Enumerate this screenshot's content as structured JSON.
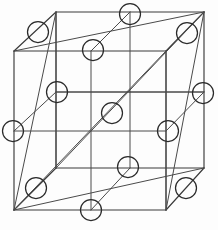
{
  "figure": {
    "kind": "crystal-lattice-diagram",
    "projection": "oblique (cavalier) parallel projection",
    "background_color": "#fdfdfd",
    "line_color": "#3a3a3a",
    "atom_stroke_color": "#2b2b2b",
    "atom_fill": "none",
    "atom_radius": 10.5,
    "canvas": {
      "width": 218,
      "height": 230
    }
  },
  "geometry": {
    "cube_vertices": {
      "front_top_left": {
        "x": 14,
        "y": 51
      },
      "front_top_right": {
        "x": 166,
        "y": 51
      },
      "front_bottom_left": {
        "x": 14,
        "y": 210
      },
      "front_bottom_right": {
        "x": 166,
        "y": 210
      },
      "back_top_left": {
        "x": 56,
        "y": 12
      },
      "back_top_right": {
        "x": 204,
        "y": 12
      },
      "back_bottom_left": {
        "x": 56,
        "y": 168
      },
      "back_bottom_right": {
        "x": 204,
        "y": 168
      }
    },
    "edges": [
      {
        "name": "front-top",
        "x1": 14,
        "y1": 51,
        "x2": 166,
        "y2": 51
      },
      {
        "name": "front-right",
        "x1": 166,
        "y1": 51,
        "x2": 166,
        "y2": 210
      },
      {
        "name": "front-bottom",
        "x1": 166,
        "y1": 210,
        "x2": 14,
        "y2": 210
      },
      {
        "name": "front-left",
        "x1": 14,
        "y1": 210,
        "x2": 14,
        "y2": 51
      },
      {
        "name": "back-top",
        "x1": 56,
        "y1": 12,
        "x2": 204,
        "y2": 12
      },
      {
        "name": "back-right",
        "x1": 204,
        "y1": 12,
        "x2": 204,
        "y2": 168
      },
      {
        "name": "back-bottom",
        "x1": 204,
        "y1": 168,
        "x2": 56,
        "y2": 168
      },
      {
        "name": "back-left",
        "x1": 56,
        "y1": 168,
        "x2": 56,
        "y2": 12
      },
      {
        "name": "depth-top-left",
        "x1": 14,
        "y1": 51,
        "x2": 56,
        "y2": 12
      },
      {
        "name": "depth-top-right",
        "x1": 166,
        "y1": 51,
        "x2": 204,
        "y2": 12
      },
      {
        "name": "depth-bottom-left",
        "x1": 14,
        "y1": 210,
        "x2": 56,
        "y2": 168
      },
      {
        "name": "depth-bottom-right",
        "x1": 166,
        "y1": 210,
        "x2": 204,
        "y2": 168
      }
    ],
    "face_diagonals": [
      {
        "name": "top-face-diagonal",
        "x1": 14,
        "y1": 51,
        "x2": 204,
        "y2": 12
      },
      {
        "name": "bottom-face-diagonal",
        "x1": 14,
        "y1": 210,
        "x2": 204,
        "y2": 168
      },
      {
        "name": "left-face-diagonal",
        "x1": 14,
        "y1": 210,
        "x2": 56,
        "y2": 12
      },
      {
        "name": "right-face-diagonal",
        "x1": 166,
        "y1": 210,
        "x2": 204,
        "y2": 12
      },
      {
        "name": "front-face-diagonal",
        "x1": 14,
        "y1": 210,
        "x2": 166,
        "y2": 51
      },
      {
        "name": "back-face-diagonal",
        "x1": 56,
        "y1": 168,
        "x2": 204,
        "y2": 12
      }
    ],
    "interior_guides": [
      {
        "name": "mid-horizontal-front-plane",
        "x1": 14,
        "y1": 131,
        "x2": 166,
        "y2": 131
      },
      {
        "name": "mid-horizontal-back-plane",
        "x1": 56,
        "y1": 92,
        "x2": 204,
        "y2": 92
      },
      {
        "name": "mid-vertical-front-plane",
        "x1": 91,
        "y1": 51,
        "x2": 91,
        "y2": 210
      },
      {
        "name": "mid-vertical-back-plane",
        "x1": 130,
        "y1": 12,
        "x2": 130,
        "y2": 168
      },
      {
        "name": "mid-depth-top",
        "x1": 91,
        "y1": 51,
        "x2": 130,
        "y2": 12
      },
      {
        "name": "mid-depth-bottom",
        "x1": 91,
        "y1": 210,
        "x2": 130,
        "y2": 168
      },
      {
        "name": "mid-depth-left",
        "x1": 14,
        "y1": 131,
        "x2": 56,
        "y2": 92
      },
      {
        "name": "mid-depth-right",
        "x1": 166,
        "y1": 131,
        "x2": 204,
        "y2": 92
      },
      {
        "name": "mid-plane-vertical-left",
        "x1": 56,
        "y1": 12,
        "x2": 56,
        "y2": 168
      },
      {
        "name": "mid-plane-vertical-right",
        "x1": 166,
        "y1": 51,
        "x2": 166,
        "y2": 210
      },
      {
        "name": "mid-plane-horizontal-a",
        "x1": 130,
        "y1": 92,
        "x2": 204,
        "y2": 92
      },
      {
        "name": "mid-plane-horizontal-b",
        "x1": 56,
        "y1": 92,
        "x2": 130,
        "y2": 92
      }
    ]
  },
  "atoms": [
    {
      "id": "corner-front-top-left",
      "role": "corner",
      "x": 14,
      "y": 51
    },
    {
      "id": "corner-front-top-right",
      "role": "corner",
      "x": 166,
      "y": 51
    },
    {
      "id": "corner-front-bottom-left",
      "role": "corner",
      "x": 14,
      "y": 210
    },
    {
      "id": "corner-front-bottom-right",
      "role": "corner",
      "x": 166,
      "y": 210
    },
    {
      "id": "corner-back-top-left",
      "role": "corner",
      "x": 56,
      "y": 12
    },
    {
      "id": "corner-back-top-right",
      "role": "corner",
      "x": 204,
      "y": 12
    },
    {
      "id": "corner-back-bottom-left",
      "role": "corner",
      "x": 56,
      "y": 168
    },
    {
      "id": "corner-back-bottom-right",
      "role": "corner",
      "x": 204,
      "y": 168
    },
    {
      "id": "face-centre-top",
      "role": "face-centre",
      "x": 110,
      "y": 31
    },
    {
      "id": "face-centre-bottom",
      "role": "face-centre",
      "x": 110,
      "y": 189
    },
    {
      "id": "face-centre-left",
      "role": "face-centre",
      "x": 35,
      "y": 110
    },
    {
      "id": "face-centre-right",
      "role": "face-centre",
      "x": 185,
      "y": 110
    },
    {
      "id": "face-centre-front",
      "role": "face-centre",
      "x": 90,
      "y": 131
    },
    {
      "id": "face-centre-back",
      "role": "face-centre",
      "x": 130,
      "y": 90
    }
  ],
  "visible_atom_markers": [
    {
      "id": "marker-1",
      "x": 130,
      "y": 14
    },
    {
      "id": "marker-2",
      "x": 38,
      "y": 32
    },
    {
      "id": "marker-3",
      "x": 187,
      "y": 33
    },
    {
      "id": "marker-4",
      "x": 93,
      "y": 50
    },
    {
      "id": "marker-5",
      "x": 57,
      "y": 92
    },
    {
      "id": "marker-6",
      "x": 203,
      "y": 93
    },
    {
      "id": "marker-7",
      "x": 112,
      "y": 113
    },
    {
      "id": "marker-8",
      "x": 13,
      "y": 131
    },
    {
      "id": "marker-9",
      "x": 168,
      "y": 131
    },
    {
      "id": "marker-10",
      "x": 128,
      "y": 167
    },
    {
      "id": "marker-11",
      "x": 36,
      "y": 188
    },
    {
      "id": "marker-12",
      "x": 186,
      "y": 188
    },
    {
      "id": "marker-13",
      "x": 91,
      "y": 210
    }
  ]
}
